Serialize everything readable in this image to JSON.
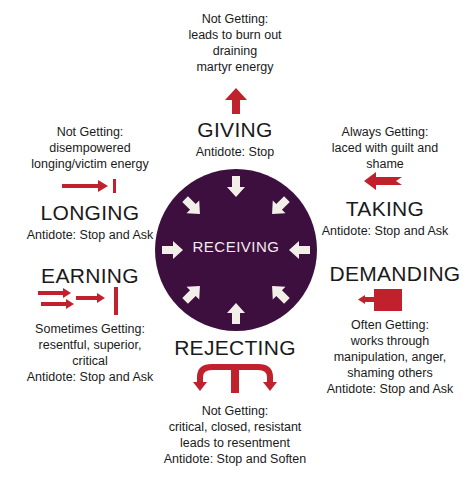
{
  "colors": {
    "circle": "#3d0f3e",
    "arrow_red": "#c0212c",
    "inner_arrows": "#f2efe9",
    "text": "#1a1a1a"
  },
  "center": {
    "label": "RECEIVING"
  },
  "giving": {
    "desc": [
      "Not Getting:",
      "leads to burn out",
      "draining",
      "martyr energy"
    ],
    "title": "GIVING",
    "antidote": "Antidote: Stop",
    "icon": "arrow-up-icon"
  },
  "longing": {
    "desc": [
      "Not Getting:",
      "disempowered",
      "longing/victim energy"
    ],
    "title": "LONGING",
    "antidote": "Antidote: Stop and Ask",
    "icon": "arrow-right-to-bar-icon"
  },
  "earning": {
    "title": "EARNING",
    "desc": [
      "Sometimes Getting:",
      "resentful, superior,",
      "critical"
    ],
    "antidote": "Antidote: Stop and Ask",
    "icon": "multiple-arrows-to-bar-icon"
  },
  "taking": {
    "desc": [
      "Always Getting:",
      "laced with guilt and",
      "shame"
    ],
    "title": "TAKING",
    "antidote": "Antidote: Stop and Ask",
    "icon": "arrow-left-notched-icon"
  },
  "demanding": {
    "title": "DEMANDING",
    "desc": [
      "Often Getting:",
      "works through",
      "manipulation, anger,",
      "shaming others"
    ],
    "antidote": "Antidote: Stop and Ask",
    "icon": "block-arrow-left-icon"
  },
  "rejecting": {
    "title": "REJECTING",
    "desc": [
      "Not Getting:",
      "critical, closed, resistant",
      "leads to resentment"
    ],
    "antidote": "Antidote: Stop and Soften",
    "icon": "split-arrow-down-icon"
  }
}
